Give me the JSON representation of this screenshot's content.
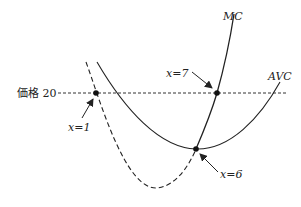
{
  "diagram": {
    "price_label": "価格 20",
    "curves": {
      "mc_label": "MC",
      "avc_label": "AVC"
    },
    "points": {
      "p1_label": "x=1",
      "p7_label": "x=7",
      "p6_label": "x=6"
    },
    "colors": {
      "line": "#222222",
      "background": "#ffffff"
    }
  }
}
